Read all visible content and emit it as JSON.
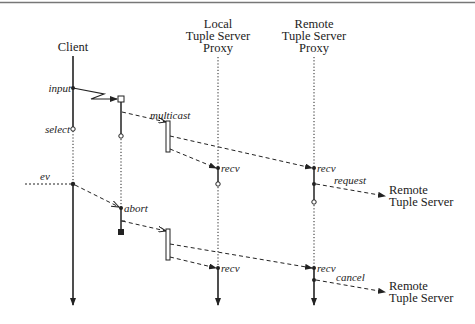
{
  "diagram": {
    "lifelines": {
      "client": {
        "label": "Client"
      },
      "local_proxy": {
        "line1": "Local",
        "line2": "Tuple Server",
        "line3": "Proxy"
      },
      "remote_proxy": {
        "line1": "Remote",
        "line2": "Tuple Server",
        "line3": "Proxy"
      }
    },
    "events": {
      "input": "input",
      "select": "select",
      "multicast": "multicast",
      "recv_local_1": "recv",
      "recv_remote_1": "recv",
      "request": "request",
      "ev": "ev",
      "abort": "abort",
      "recv_local_2": "recv",
      "recv_remote_2": "recv",
      "cancel": "cancel"
    },
    "external_targets": {
      "request_target": {
        "line1": "Remote",
        "line2": "Tuple Server"
      },
      "cancel_target": {
        "line1": "Remote",
        "line2": "Tuple Server"
      }
    },
    "colors": {
      "line": "#222222",
      "border": "#777777",
      "background": "#ffffff"
    }
  }
}
